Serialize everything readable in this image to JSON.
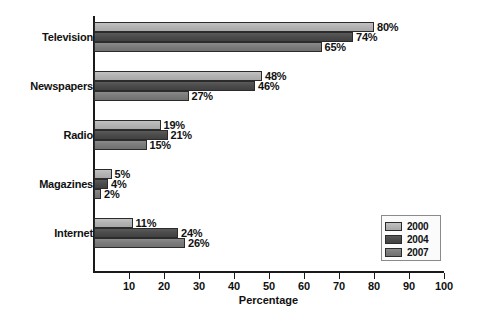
{
  "chart_data": {
    "type": "bar",
    "orientation": "horizontal",
    "title": "",
    "xlabel": "Percentage",
    "ylabel": "",
    "xlim": [
      0,
      100
    ],
    "xticks": [
      10,
      20,
      30,
      40,
      50,
      60,
      70,
      80,
      90,
      100
    ],
    "grid": false,
    "legend_position": "bottom-right",
    "categories": [
      "Television",
      "Newspapers",
      "Radio",
      "Magazines",
      "Internet"
    ],
    "series": [
      {
        "name": "2000",
        "color": "#b4b4b4",
        "values": [
          80,
          48,
          19,
          5,
          11
        ]
      },
      {
        "name": "2004",
        "color": "#4c4c4c",
        "values": [
          74,
          46,
          21,
          4,
          24
        ]
      },
      {
        "name": "2007",
        "color": "#7c7c7c",
        "values": [
          65,
          27,
          15,
          2,
          26
        ]
      }
    ],
    "value_labels": [
      [
        "80%",
        "48%",
        "19%",
        "5%",
        "11%"
      ],
      [
        "74%",
        "46%",
        "21%",
        "4%",
        "24%"
      ],
      [
        "65%",
        "27%",
        "15%",
        "2%",
        "26%"
      ]
    ]
  },
  "axis": {
    "tick_labels": [
      "10",
      "20",
      "30",
      "40",
      "50",
      "60",
      "70",
      "80",
      "90",
      "100"
    ],
    "x_title": "Percentage"
  },
  "legend": {
    "entries": [
      {
        "label": "2000"
      },
      {
        "label": "2004"
      },
      {
        "label": "2007"
      }
    ]
  }
}
